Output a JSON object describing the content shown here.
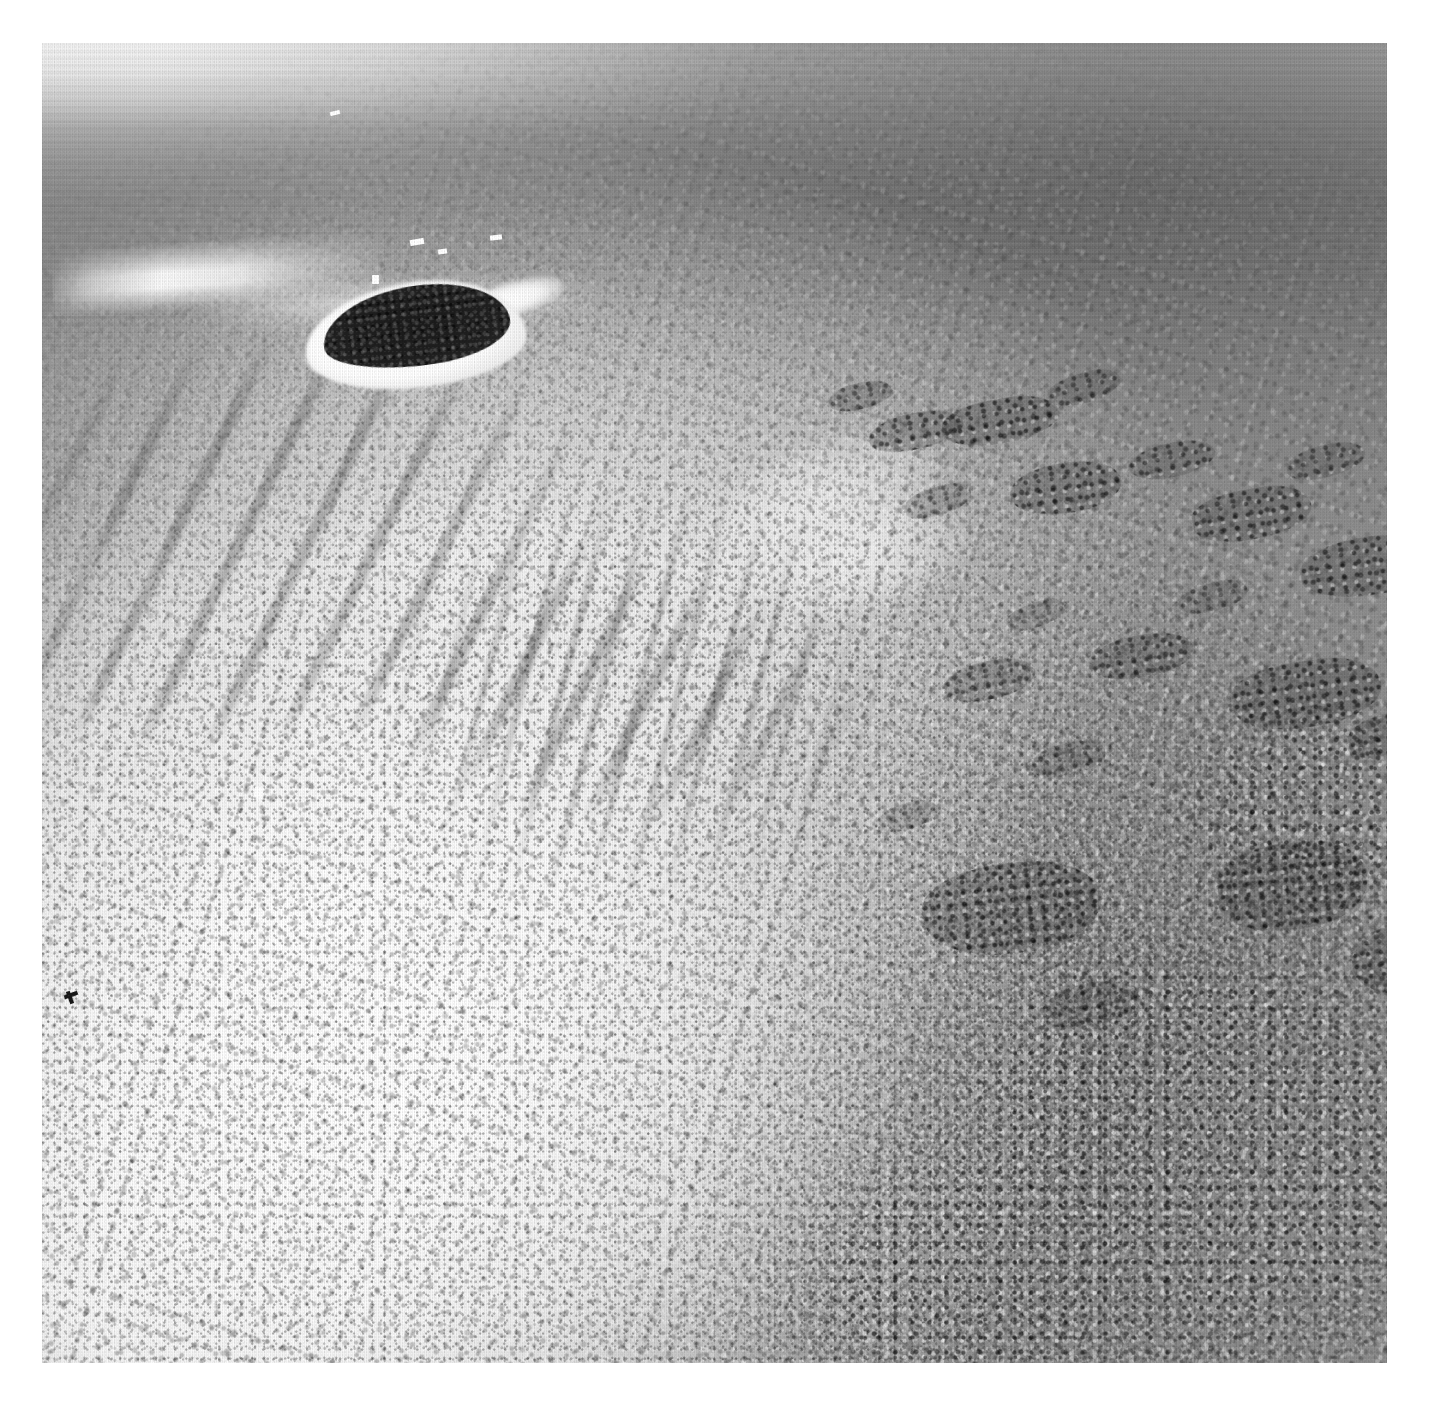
{
  "page": {
    "kind": "photograph",
    "medium": "black-and-white aerial photographic print",
    "background_color": "#ffffff",
    "width": 1431,
    "height": 1407
  },
  "print": {
    "left": 42,
    "top": 43,
    "width": 1345,
    "height": 1320,
    "border_color": "#ffffff",
    "caption": ""
  },
  "scene": {
    "subject": "Coral reef and sand cay seen from the air",
    "viewpoint": "oblique aerial, looking seaward toward a hazy horizon",
    "tone_range": "pure white coral sand to near-black vegetation",
    "palette": {
      "paper_white": "#ffffff",
      "horizon_haze": "#f0f0f0",
      "deep_water": "#787878",
      "open_water": "#8e8e8e",
      "lagoon_water": "#8a8a8a",
      "sand_flat": "#f7f7f7",
      "coral_rubble": "#c8c8c8",
      "seagrass_dark": "#4a4a4a",
      "island_vegetation": "#222222",
      "surf_white": "#ffffff"
    }
  },
  "features": {
    "horizon": {
      "label": "Hazy horizon band",
      "position": "top edge",
      "tone": "#f0f0f0"
    },
    "open_water": {
      "label": "Open ocean",
      "position": "upper third",
      "tone": "#8e8e8e"
    },
    "deep_channel": {
      "label": "Deeper water channel",
      "position": "upper right",
      "tone": "#787878"
    },
    "cay": {
      "label": "Vegetated sand cay",
      "position": "upper left",
      "vegetation_tone": "#222222",
      "beach_tone": "#ffffff",
      "sand_spit": "trailing east"
    },
    "surf_line": {
      "label": "Breaking surf on the reef crest",
      "position": "left of the cay",
      "tone": "#ffffff"
    },
    "reef_flat": {
      "label": "Bright coral reef flat",
      "position": "centre and lower left",
      "tone": "#f0f0f0"
    },
    "sand_apron": {
      "label": "Pale sand apron / blowout",
      "position": "left centre",
      "tone": "#fafafa"
    },
    "seagrass": {
      "label": "Dark seagrass and algal streaks",
      "position": "upper left of reef flat",
      "tone": "#4a4a4a",
      "orientation": "diagonal, NW to SE"
    },
    "spur_and_groove": {
      "label": "Spur-and-groove striations",
      "position": "centre of reef flat",
      "tone": "#707070"
    },
    "lagoon": {
      "label": "Shallow lagoon",
      "position": "right side",
      "tone": "#8a8a8a"
    },
    "patch_reefs": {
      "label": "Scattered patch reefs",
      "position": "throughout the lagoon",
      "tone": "#5e5e5e",
      "count": 22
    },
    "coral_field": {
      "label": "Dense coral rubble field",
      "position": "lower right",
      "tone": "#6a6a6a"
    },
    "specks": {
      "label": "Small bright and dark marks (vessels / print flecks)",
      "count": 8
    }
  },
  "patch_reefs": [
    {
      "x": 786,
      "y": 340,
      "w": 64,
      "h": 26,
      "r": -14,
      "o": 0.8
    },
    {
      "x": 826,
      "y": 370,
      "w": 96,
      "h": 36,
      "r": -12,
      "o": 0.9
    },
    {
      "x": 900,
      "y": 356,
      "w": 118,
      "h": 44,
      "r": -10,
      "o": 0.95
    },
    {
      "x": 1005,
      "y": 330,
      "w": 74,
      "h": 30,
      "r": -16,
      "o": 0.78
    },
    {
      "x": 968,
      "y": 420,
      "w": 112,
      "h": 50,
      "r": -8,
      "o": 0.92
    },
    {
      "x": 862,
      "y": 444,
      "w": 68,
      "h": 28,
      "r": -18,
      "o": 0.7
    },
    {
      "x": 1086,
      "y": 400,
      "w": 88,
      "h": 34,
      "r": -12,
      "o": 0.8
    },
    {
      "x": 1150,
      "y": 446,
      "w": 120,
      "h": 50,
      "r": -10,
      "o": 0.88
    },
    {
      "x": 1244,
      "y": 402,
      "w": 80,
      "h": 32,
      "r": -14,
      "o": 0.74
    },
    {
      "x": 1258,
      "y": 494,
      "w": 136,
      "h": 58,
      "r": -8,
      "o": 0.9
    },
    {
      "x": 1136,
      "y": 540,
      "w": 70,
      "h": 28,
      "r": -16,
      "o": 0.66
    },
    {
      "x": 964,
      "y": 560,
      "w": 60,
      "h": 24,
      "r": -20,
      "o": 0.6
    },
    {
      "x": 1048,
      "y": 592,
      "w": 104,
      "h": 42,
      "r": -10,
      "o": 0.84
    },
    {
      "x": 902,
      "y": 618,
      "w": 92,
      "h": 38,
      "r": -12,
      "o": 0.8
    },
    {
      "x": 1190,
      "y": 618,
      "w": 150,
      "h": 66,
      "r": -8,
      "o": 0.92
    },
    {
      "x": 1306,
      "y": 668,
      "w": 110,
      "h": 48,
      "r": -10,
      "o": 0.86
    },
    {
      "x": 988,
      "y": 700,
      "w": 76,
      "h": 32,
      "r": -14,
      "o": 0.7
    },
    {
      "x": 836,
      "y": 760,
      "w": 60,
      "h": 26,
      "r": -18,
      "o": 0.58
    },
    {
      "x": 880,
      "y": 820,
      "w": 180,
      "h": 90,
      "r": -6,
      "o": 0.94
    },
    {
      "x": 1176,
      "y": 800,
      "w": 150,
      "h": 86,
      "r": -6,
      "o": 0.9
    },
    {
      "x": 1310,
      "y": 880,
      "w": 120,
      "h": 70,
      "r": -8,
      "o": 0.82
    },
    {
      "x": 1000,
      "y": 940,
      "w": 96,
      "h": 44,
      "r": -12,
      "o": 0.72
    }
  ],
  "sand_tongues": [
    {
      "x": 650,
      "y": 400,
      "w": 260,
      "h": 130,
      "r": -22
    },
    {
      "x": 720,
      "y": 470,
      "w": 210,
      "h": 96,
      "r": -18
    },
    {
      "x": 120,
      "y": 800,
      "w": 330,
      "h": 170,
      "r": -14
    },
    {
      "x": 230,
      "y": 880,
      "w": 280,
      "h": 140,
      "r": -12
    }
  ],
  "specks": [
    {
      "kind": "dark",
      "x": 22,
      "y": 950,
      "w": 14,
      "h": 4,
      "r": -20
    },
    {
      "kind": "dark",
      "x": 26,
      "y": 948,
      "w": 4,
      "h": 13,
      "r": -20
    },
    {
      "kind": "light",
      "x": 212,
      "y": 744,
      "w": 9,
      "h": 11,
      "r": 8
    },
    {
      "kind": "light",
      "x": 368,
      "y": 196,
      "w": 14,
      "h": 6,
      "r": -10
    },
    {
      "kind": "light",
      "x": 396,
      "y": 206,
      "w": 9,
      "h": 5,
      "r": -8
    },
    {
      "kind": "light",
      "x": 448,
      "y": 192,
      "w": 12,
      "h": 5,
      "r": -6
    },
    {
      "kind": "light",
      "x": 288,
      "y": 68,
      "w": 10,
      "h": 4,
      "r": -14
    },
    {
      "kind": "light",
      "x": 330,
      "y": 232,
      "w": 7,
      "h": 9,
      "r": 0
    }
  ]
}
